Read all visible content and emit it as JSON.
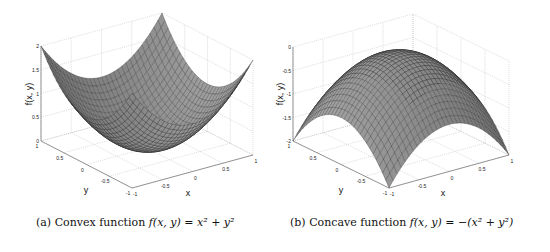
{
  "chart_data": [
    {
      "type": "surface3d",
      "title": "",
      "caption": "(a) Convex function f(x, y) = x^2 + y^2",
      "caption_label": "(a)",
      "caption_text": "Convex function",
      "caption_formula": "f(x, y) = x² + y²",
      "function": "x^2 + y^2",
      "xlabel": "x",
      "ylabel": "y",
      "zlabel": "f(x, y)",
      "xlim": [
        -1,
        1
      ],
      "ylim": [
        -1,
        1
      ],
      "zlim": [
        0,
        2
      ],
      "xticks": [
        "-1",
        "-0.5",
        "0",
        "0.5",
        "1"
      ],
      "yticks": [
        "-1",
        "-0.5",
        "0",
        "0.5",
        "1"
      ],
      "zticks": [
        "0",
        "0.5",
        "1",
        "1.5",
        "2"
      ],
      "grid": true,
      "colormap": "gray",
      "samples": {
        "x": [
          -1,
          0,
          1
        ],
        "y": [
          -1,
          0,
          1
        ],
        "z": [
          [
            2,
            1,
            2
          ],
          [
            1,
            0,
            1
          ],
          [
            2,
            1,
            2
          ]
        ]
      }
    },
    {
      "type": "surface3d",
      "title": "",
      "caption": "(b) Concave function f(x, y) = -(x^2 + y^2)",
      "caption_label": "(b)",
      "caption_text": "Concave function",
      "caption_formula": "f(x, y) = −(x² + y²)",
      "function": "-(x^2 + y^2)",
      "xlabel": "x",
      "ylabel": "y",
      "zlabel": "f(x, y)",
      "xlim": [
        -1,
        1
      ],
      "ylim": [
        -1,
        1
      ],
      "zlim": [
        -2,
        0
      ],
      "xticks": [
        "-1",
        "-0.5",
        "0",
        "0.5",
        "1"
      ],
      "yticks": [
        "-1",
        "-0.5",
        "0",
        "0.5",
        "1"
      ],
      "zticks": [
        "-2",
        "-1.5",
        "-1",
        "-0.5",
        "0"
      ],
      "grid": true,
      "colormap": "gray",
      "samples": {
        "x": [
          -1,
          0,
          1
        ],
        "y": [
          -1,
          0,
          1
        ],
        "z": [
          [
            -2,
            -1,
            -2
          ],
          [
            -1,
            0,
            -1
          ],
          [
            -2,
            -1,
            -2
          ]
        ]
      }
    }
  ]
}
